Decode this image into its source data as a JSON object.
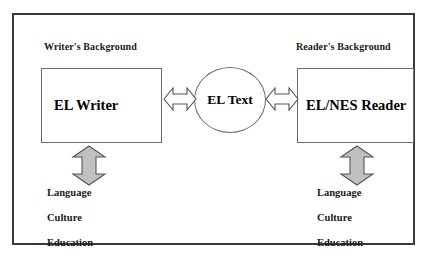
{
  "diagram": {
    "colors": {
      "frame_border": "#3a3a3a",
      "box_border": "#6b6b6b",
      "vertical_arrow_fill": "#c0c0c0",
      "vertical_arrow_stroke": "#555555",
      "horizontal_arrow_fill": "#ffffff",
      "horizontal_arrow_stroke": "#555555",
      "text": "#1a1a1a",
      "background": "#ffffff"
    },
    "left_section": {
      "heading": "Writer's Background",
      "actor_label": "EL Writer",
      "arrow_name": "writer-background-arrow",
      "factors": [
        "Language",
        "Culture",
        "Education"
      ]
    },
    "center": {
      "node_label": "EL Text",
      "left_arrow_name": "writer-text-arrow",
      "right_arrow_name": "text-reader-arrow"
    },
    "right_section": {
      "heading": "Reader's Background",
      "actor_label": "EL/NES Reader",
      "arrow_name": "reader-background-arrow",
      "factors": [
        "Language",
        "Culture",
        "Education"
      ]
    }
  }
}
